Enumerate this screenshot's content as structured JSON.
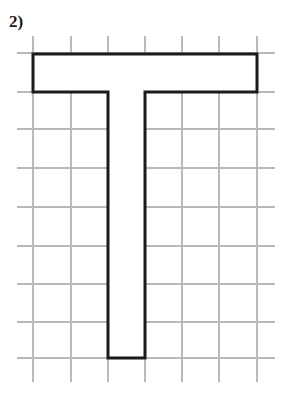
{
  "page": {
    "width": 287,
    "height": 402,
    "background_color": "#ffffff"
  },
  "problem": {
    "label": "2)"
  },
  "figure": {
    "name": "letter-t-polygon-on-grid",
    "outline_color": "#1b1b1b",
    "outline_width": 3,
    "fill_color": "#ffffff",
    "grid_color": "#b9b9b9",
    "grid_line_width": 2,
    "grid": {
      "vertical_x": [
        33,
        71,
        108,
        145,
        182,
        219,
        257
      ],
      "vertical_y_start": 36,
      "vertical_y_end": 382,
      "horizontal_y": [
        53,
        92,
        129,
        168,
        207,
        246,
        284,
        322,
        358
      ],
      "horizontal_x_start": 17,
      "horizontal_x_end": 275,
      "cell_width": 37,
      "cell_height": 38
    },
    "outline_points": "33,54 257,54 257,92 145,92 145,358 108,358 108,92 33,92",
    "vertices": [
      [
        33,
        54
      ],
      [
        257,
        54
      ],
      [
        257,
        92
      ],
      [
        145,
        92
      ],
      [
        145,
        358
      ],
      [
        108,
        358
      ],
      [
        108,
        92
      ],
      [
        33,
        92
      ]
    ],
    "dimensions_in_cells": {
      "crossbar_width": 6,
      "crossbar_height": 1,
      "stem_width": 1,
      "stem_height": 7,
      "total_height": 8
    }
  }
}
